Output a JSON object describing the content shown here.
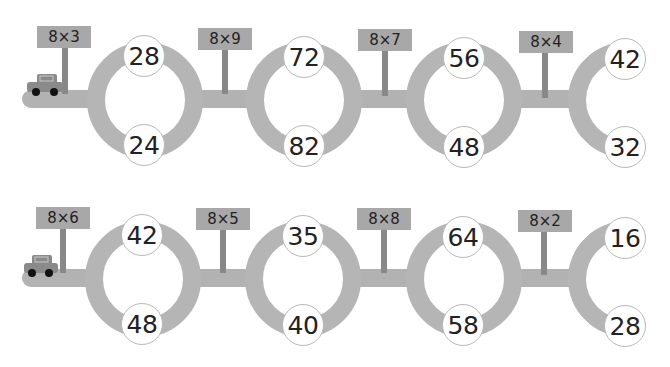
{
  "rows": [
    {
      "signs": [
        "8×3",
        "8×9",
        "8×7",
        "8×4"
      ],
      "rings": [
        {
          "top": "28",
          "bottom": "24"
        },
        {
          "top": "72",
          "bottom": "82"
        },
        {
          "top": "56",
          "bottom": "48"
        },
        {
          "top": "42",
          "bottom": "32"
        }
      ]
    },
    {
      "signs": [
        "8×6",
        "8×5",
        "8×8",
        "8×2"
      ],
      "rings": [
        {
          "top": "42",
          "bottom": "48"
        },
        {
          "top": "35",
          "bottom": "40"
        },
        {
          "top": "64",
          "bottom": "58"
        },
        {
          "top": "16",
          "bottom": "28"
        }
      ]
    }
  ],
  "icons": {
    "car": "car-icon"
  },
  "colors": {
    "road": "#b5b5b5",
    "sign": "#a8a8a8",
    "car": "#8a8a8a"
  }
}
